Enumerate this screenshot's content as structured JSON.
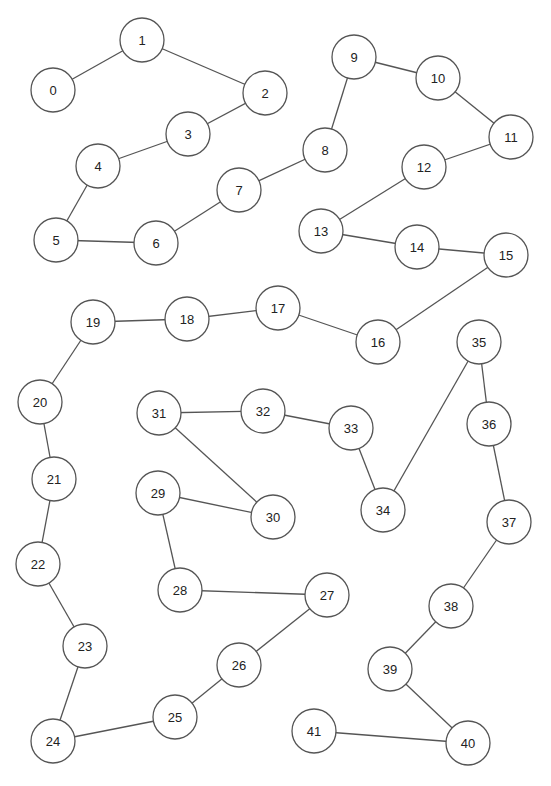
{
  "diagram": {
    "type": "graph",
    "node_radius": 22,
    "colors": {
      "stroke": "#555555",
      "fill": "#ffffff",
      "text": "#222222",
      "background": "#ffffff"
    },
    "nodes": [
      {
        "id": "0",
        "label": "0",
        "x": 53,
        "y": 90
      },
      {
        "id": "1",
        "label": "1",
        "x": 142,
        "y": 40
      },
      {
        "id": "2",
        "label": "2",
        "x": 265,
        "y": 93
      },
      {
        "id": "3",
        "label": "3",
        "x": 188,
        "y": 134
      },
      {
        "id": "4",
        "label": "4",
        "x": 98,
        "y": 166
      },
      {
        "id": "5",
        "label": "5",
        "x": 56,
        "y": 240
      },
      {
        "id": "6",
        "label": "6",
        "x": 156,
        "y": 243
      },
      {
        "id": "7",
        "label": "7",
        "x": 239,
        "y": 190
      },
      {
        "id": "8",
        "label": "8",
        "x": 325,
        "y": 150
      },
      {
        "id": "9",
        "label": "9",
        "x": 354,
        "y": 57
      },
      {
        "id": "10",
        "label": "10",
        "x": 438,
        "y": 78
      },
      {
        "id": "11",
        "label": "11",
        "x": 511,
        "y": 137
      },
      {
        "id": "12",
        "label": "12",
        "x": 424,
        "y": 167
      },
      {
        "id": "13",
        "label": "13",
        "x": 321,
        "y": 231
      },
      {
        "id": "14",
        "label": "14",
        "x": 417,
        "y": 247
      },
      {
        "id": "15",
        "label": "15",
        "x": 506,
        "y": 255
      },
      {
        "id": "16",
        "label": "16",
        "x": 378,
        "y": 342
      },
      {
        "id": "17",
        "label": "17",
        "x": 278,
        "y": 308
      },
      {
        "id": "18",
        "label": "18",
        "x": 187,
        "y": 319
      },
      {
        "id": "19",
        "label": "19",
        "x": 93,
        "y": 322
      },
      {
        "id": "20",
        "label": "20",
        "x": 40,
        "y": 402
      },
      {
        "id": "21",
        "label": "21",
        "x": 54,
        "y": 479
      },
      {
        "id": "22",
        "label": "22",
        "x": 38,
        "y": 564
      },
      {
        "id": "23",
        "label": "23",
        "x": 85,
        "y": 646
      },
      {
        "id": "24",
        "label": "24",
        "x": 53,
        "y": 741
      },
      {
        "id": "25",
        "label": "25",
        "x": 175,
        "y": 717
      },
      {
        "id": "26",
        "label": "26",
        "x": 239,
        "y": 665
      },
      {
        "id": "27",
        "label": "27",
        "x": 327,
        "y": 595
      },
      {
        "id": "28",
        "label": "28",
        "x": 180,
        "y": 590
      },
      {
        "id": "29",
        "label": "29",
        "x": 158,
        "y": 493
      },
      {
        "id": "30",
        "label": "30",
        "x": 273,
        "y": 517
      },
      {
        "id": "31",
        "label": "31",
        "x": 159,
        "y": 413
      },
      {
        "id": "32",
        "label": "32",
        "x": 263,
        "y": 411
      },
      {
        "id": "33",
        "label": "33",
        "x": 351,
        "y": 428
      },
      {
        "id": "34",
        "label": "34",
        "x": 383,
        "y": 510
      },
      {
        "id": "35",
        "label": "35",
        "x": 479,
        "y": 342
      },
      {
        "id": "36",
        "label": "36",
        "x": 489,
        "y": 424
      },
      {
        "id": "37",
        "label": "37",
        "x": 509,
        "y": 522
      },
      {
        "id": "38",
        "label": "38",
        "x": 451,
        "y": 606
      },
      {
        "id": "39",
        "label": "39",
        "x": 390,
        "y": 669
      },
      {
        "id": "40",
        "label": "40",
        "x": 468,
        "y": 743
      },
      {
        "id": "41",
        "label": "41",
        "x": 314,
        "y": 731
      }
    ],
    "edges": [
      [
        "0",
        "1"
      ],
      [
        "1",
        "2"
      ],
      [
        "2",
        "3"
      ],
      [
        "3",
        "4"
      ],
      [
        "4",
        "5"
      ],
      [
        "5",
        "6"
      ],
      [
        "6",
        "7"
      ],
      [
        "7",
        "8"
      ],
      [
        "8",
        "9"
      ],
      [
        "9",
        "10"
      ],
      [
        "10",
        "11"
      ],
      [
        "11",
        "12"
      ],
      [
        "12",
        "13"
      ],
      [
        "13",
        "14"
      ],
      [
        "14",
        "15"
      ],
      [
        "15",
        "16"
      ],
      [
        "16",
        "17"
      ],
      [
        "17",
        "18"
      ],
      [
        "18",
        "19"
      ],
      [
        "19",
        "20"
      ],
      [
        "20",
        "21"
      ],
      [
        "21",
        "22"
      ],
      [
        "22",
        "23"
      ],
      [
        "23",
        "24"
      ],
      [
        "24",
        "25"
      ],
      [
        "25",
        "26"
      ],
      [
        "26",
        "27"
      ],
      [
        "27",
        "28"
      ],
      [
        "28",
        "29"
      ],
      [
        "29",
        "30"
      ],
      [
        "30",
        "31"
      ],
      [
        "31",
        "32"
      ],
      [
        "32",
        "33"
      ],
      [
        "33",
        "34"
      ],
      [
        "34",
        "35"
      ],
      [
        "35",
        "36"
      ],
      [
        "36",
        "37"
      ],
      [
        "37",
        "38"
      ],
      [
        "38",
        "39"
      ],
      [
        "39",
        "40"
      ],
      [
        "40",
        "41"
      ]
    ]
  }
}
